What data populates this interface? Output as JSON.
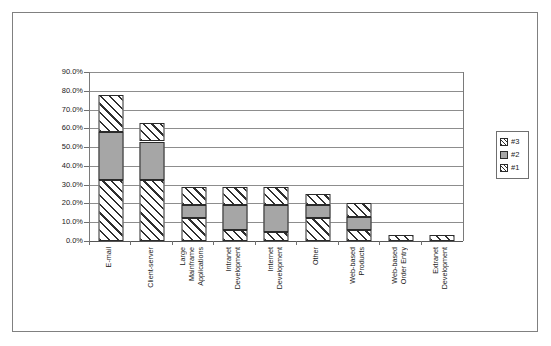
{
  "chart_data": {
    "type": "bar",
    "subtype": "stacked-bar",
    "title": "",
    "subtitle": "",
    "xlabel": "",
    "ylabel": "",
    "ylim": [
      0,
      90
    ],
    "ytick_labels": [
      "90.0%",
      "80.0%",
      "70.0%",
      "60.0%",
      "50.0%",
      "40.0%",
      "30.0%",
      "20.0%",
      "10.0%",
      "0.0%"
    ],
    "ytick_values": [
      90,
      80,
      70,
      60,
      50,
      40,
      30,
      20,
      10,
      0
    ],
    "yaxis_unit": "percent",
    "grid": true,
    "grid_axis": "y",
    "legend_position": "right",
    "categories": [
      "E-mail",
      "Client-server",
      "Large Mainframe Applications",
      "Intranet Development",
      "Internet Development",
      "Other",
      "Web-based Products",
      "Web-based Order Entry",
      "Extranet Development"
    ],
    "category_lines": [
      [
        "E-mail"
      ],
      [
        "Client-server"
      ],
      [
        "Large",
        "Mainframe",
        "Applications"
      ],
      [
        "Intranet",
        "Development"
      ],
      [
        "Internet",
        "Development"
      ],
      [
        "Other"
      ],
      [
        "Web-based",
        "Products"
      ],
      [
        "Web-based",
        "Order Entry"
      ],
      [
        "Extranet",
        "Development"
      ]
    ],
    "series": [
      {
        "name": "#1",
        "pattern": "diagonal-hatch",
        "color": "#ffffff",
        "values": [
          32.5,
          32.5,
          12.0,
          6.0,
          5.0,
          12.0,
          6.0,
          0.0,
          0.0
        ]
      },
      {
        "name": "#2",
        "pattern": "solid-gray",
        "color": "#a6a6a6",
        "values": [
          25.5,
          20.5,
          7.0,
          13.0,
          14.0,
          7.0,
          7.0,
          0.0,
          0.0
        ]
      },
      {
        "name": "#3",
        "pattern": "diagonal-hatch",
        "color": "#ffffff",
        "values": [
          20.0,
          10.0,
          10.0,
          10.0,
          10.0,
          6.0,
          7.0,
          3.0,
          3.0
        ]
      }
    ],
    "totals": [
      78.0,
      63.0,
      29.0,
      29.0,
      29.0,
      25.0,
      20.0,
      3.0,
      3.0
    ]
  },
  "legend": {
    "entries": [
      {
        "label": "#3"
      },
      {
        "label": "#2"
      },
      {
        "label": "#1"
      }
    ]
  }
}
